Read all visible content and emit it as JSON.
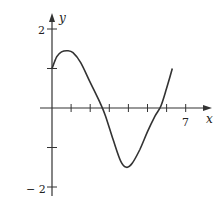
{
  "chart_data": {
    "type": "line",
    "title": "",
    "xlabel": "x",
    "ylabel": "y",
    "xlim": [
      0,
      7.3
    ],
    "ylim": [
      -2.1,
      2.3
    ],
    "grid": false,
    "legend": null,
    "x_ticks": [
      1,
      2,
      3,
      4,
      5,
      6,
      7
    ],
    "x_tick_labels": {
      "7": "7"
    },
    "y_ticks": [
      -2,
      -1,
      1,
      2
    ],
    "y_tick_labels": {
      "2": "2",
      "-2": "− 2"
    },
    "series": [
      {
        "name": "curve",
        "x": [
          0,
          0.25,
          0.5,
          0.8,
          1.1,
          1.5,
          2.0,
          2.5,
          2.8,
          3.2,
          3.6,
          3.9,
          4.2,
          4.6,
          5.0,
          5.4,
          5.7,
          6.0,
          6.3
        ],
        "y": [
          1.0,
          1.3,
          1.42,
          1.45,
          1.4,
          1.15,
          0.65,
          0.15,
          -0.2,
          -0.8,
          -1.35,
          -1.5,
          -1.4,
          -1.05,
          -0.6,
          -0.2,
          0.05,
          0.5,
          1.0
        ]
      }
    ]
  },
  "labels": {
    "x_axis": "x",
    "y_axis": "y",
    "tick_7": "7",
    "tick_2": "2",
    "tick_neg2": "− 2"
  },
  "colors": {
    "axis": "#333333",
    "curve": "#333333",
    "background": "#ffffff"
  }
}
